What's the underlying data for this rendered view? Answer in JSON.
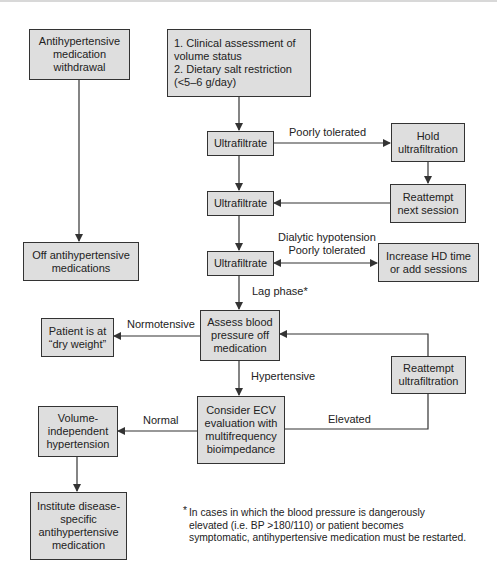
{
  "diagram": {
    "type": "flowchart",
    "nodes": {
      "withdrawal": "Antihypertensive\nmedication\nwithdrawal",
      "assessment": "1. Clinical assessment of\n    volume status\n2. Dietary salt restriction\n    (<5–6 g/day)",
      "uf1": "Ultrafiltrate",
      "hold_uf": "Hold\nultrafiltration",
      "uf2": "Ultrafiltrate",
      "reattempt_next": "Reattempt\nnext session",
      "off_meds": "Off antihypertensive\nmedications",
      "uf3": "Ultrafiltrate",
      "increase_hd": "Increase HD time\nor add sessions",
      "assess_bp": "Assess blood\npressure off\nmedication",
      "dry_weight": "Patient is at\n“dry weight”",
      "reattempt_uf": "Reattempt\nultrafiltration",
      "consider_ecv": "Consider ECV\nevaluation with\nmultifrequency\nbioimpedance",
      "volume_independent": "Volume-\nindependent\nhypertension",
      "institute": "Institute disease-\nspecific\nantihypertensive\nmedication"
    },
    "edge_labels": {
      "poorly_tolerated": "Poorly tolerated",
      "dialytic_hypotension": "Dialytic hypotension\nPoorly tolerated",
      "lag_phase": "Lag phase*",
      "normotensive": "Normotensive",
      "hypertensive": "Hypertensive",
      "normal": "Normal",
      "elevated": "Elevated"
    },
    "footnote": "In cases in which the blood pressure is dangerously\nelevated  (i.e. BP >180/110) or patient becomes\nsymptomatic, antihypertensive medication must be restarted.",
    "footnote_marker": "*",
    "colors": {
      "box_fill": "#dedede",
      "box_border": "#333333",
      "line": "#333333"
    }
  }
}
